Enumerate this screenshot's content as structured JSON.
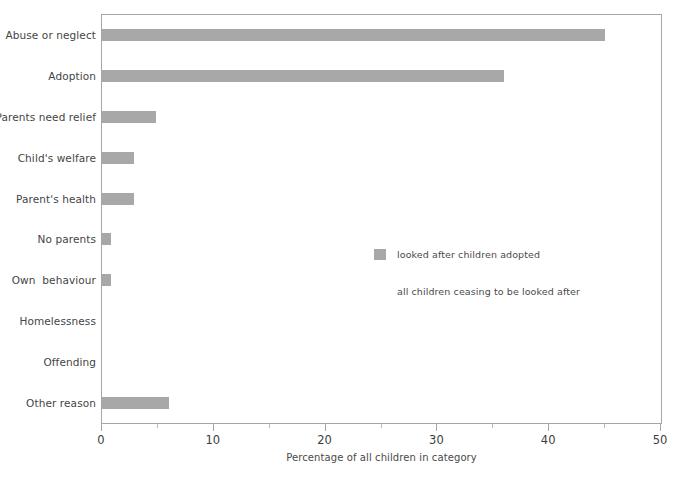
{
  "chart_data": {
    "type": "bar",
    "orientation": "horizontal",
    "title": "",
    "xlabel": "Percentage of all children in category",
    "ylabel": "",
    "xlim": [
      0,
      50
    ],
    "xticks": [
      0,
      10,
      20,
      30,
      40,
      50
    ],
    "xtick_labels": [
      "0",
      "10",
      "20",
      "30",
      "40",
      "50"
    ],
    "xminor_ticks": [
      5,
      15,
      25,
      35,
      45
    ],
    "grid": false,
    "legend_position": "inside-center-right",
    "categories": [
      "Abuse or neglect",
      "Adoption",
      "Parents need relief",
      "Child's welfare",
      "Parent's health",
      "No parents",
      "Own  behaviour",
      "Homelessness",
      "Offending",
      "Other reason"
    ],
    "series": [
      {
        "name": "looked after children adopted",
        "color": "#a8a8a8",
        "values": [
          45.0,
          36.0,
          4.8,
          2.9,
          2.9,
          0.8,
          0.8,
          0.0,
          0.0,
          6.0
        ]
      },
      {
        "name": "all children ceasing to be looked after",
        "color": "#ffffff",
        "values": [
          0,
          0,
          0,
          0,
          0,
          0,
          0,
          0,
          0,
          0
        ]
      }
    ],
    "legend": [
      {
        "label": "looked after children adopted",
        "swatch": "filled",
        "color": "#a8a8a8"
      },
      {
        "label": "all children ceasing to be looked after",
        "swatch": "blank",
        "color": "#ffffff"
      }
    ]
  },
  "colors": {
    "bar": "#a8a8a8",
    "frame": "#a6a6a6",
    "text": "#454545",
    "background": "#ffffff"
  }
}
